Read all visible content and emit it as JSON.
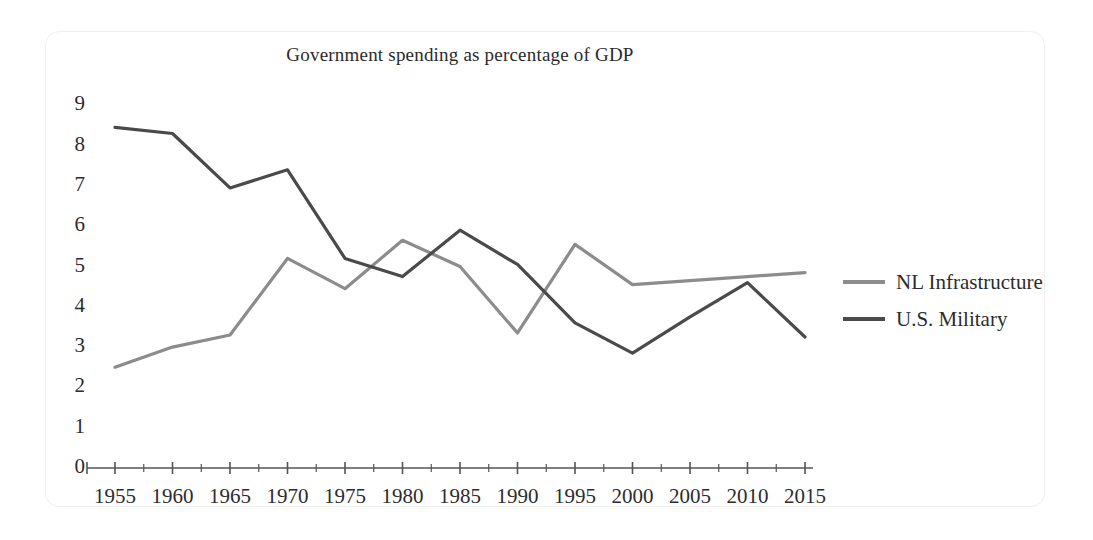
{
  "chart_data": {
    "type": "line",
    "title": "Government spending as percentage of GDP",
    "xlabel": "",
    "ylabel": "",
    "grid": false,
    "legend_position": "right",
    "x": [
      1955,
      1960,
      1965,
      1970,
      1975,
      1980,
      1985,
      1990,
      1995,
      2000,
      2005,
      2010,
      2015
    ],
    "categories": [
      "1955",
      "1960",
      "1965",
      "1970",
      "1975",
      "1980",
      "1985",
      "1990",
      "1995",
      "2000",
      "2005",
      "2010",
      "2015"
    ],
    "xlim": [
      1955,
      2015
    ],
    "ylim": [
      0,
      9
    ],
    "yticks": [
      0,
      1,
      2,
      3,
      4,
      5,
      6,
      7,
      8,
      9
    ],
    "ytick_labels": [
      "0",
      "1",
      "2",
      "3",
      "4",
      "5",
      "6",
      "7",
      "8",
      "9"
    ],
    "series": [
      {
        "name": "NL Infrastructure",
        "color": "#8c8c8c",
        "values": [
          2.5,
          3.0,
          3.3,
          5.2,
          4.45,
          5.65,
          5.0,
          3.35,
          5.55,
          4.55,
          4.65,
          4.75,
          4.85
        ]
      },
      {
        "name": "U.S. Military",
        "color": "#4a4a4a",
        "values": [
          8.45,
          8.3,
          6.95,
          7.4,
          5.2,
          4.75,
          5.9,
          5.05,
          3.6,
          2.85,
          3.75,
          4.6,
          3.25
        ]
      }
    ]
  },
  "legend": {
    "items": [
      {
        "label": "NL Infrastructure",
        "color": "#8c8c8c"
      },
      {
        "label": "U.S. Military",
        "color": "#4a4a4a"
      }
    ]
  },
  "axis": {
    "axis_color": "#555555"
  }
}
